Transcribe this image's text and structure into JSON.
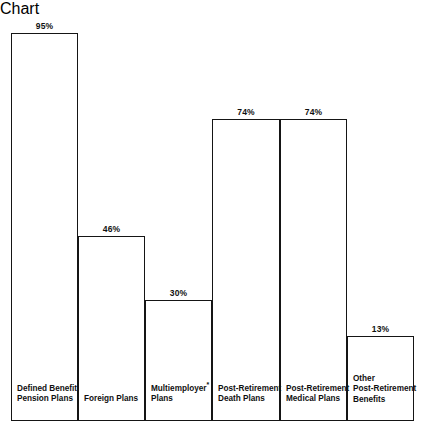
{
  "chart_data": {
    "type": "bar",
    "title": "",
    "subtitle": "",
    "xlabel": "",
    "ylabel": "",
    "ylim": [
      0,
      100
    ],
    "grid": false,
    "legend": false,
    "categories": [
      "Defined Benefit\nPension Plans",
      "Foreign Plans",
      "Multiemployer*\nPlans",
      "Post-Retirement\nDeath Plans",
      "Post-Retirement\nMedical Plans",
      "Other\nPost-Retirement\nBenefits"
    ],
    "values": [
      95,
      46,
      30,
      74,
      74,
      13
    ],
    "value_labels": [
      "95%",
      "46%",
      "30%",
      "74%",
      "74%",
      "13%"
    ],
    "footnote_marker": "*",
    "series_color": "#151515"
  },
  "bars": [
    {
      "label": "Defined Benefit\nPension Plans",
      "value_label": "95%",
      "value": 95,
      "left": 11,
      "width": 67,
      "top": 15,
      "label_top": 366
    },
    {
      "label": "Foreign Plans",
      "value_label": "46%",
      "value": 46,
      "left": 78,
      "width": 67,
      "top": 218,
      "label_top": 376
    },
    {
      "label": "Multiemployer*\nPlans",
      "value_label": "30%",
      "value": 30,
      "left": 145,
      "width": 67,
      "top": 282,
      "label_top": 366
    },
    {
      "label": "Post-Retirement\nDeath Plans",
      "value_label": "74%",
      "value": 74,
      "left": 212,
      "width": 68,
      "top": 101,
      "label_top": 366
    },
    {
      "label": "Post-Retirement\nMedical Plans",
      "value_label": "74%",
      "value": 74,
      "left": 280,
      "width": 67,
      "top": 101,
      "label_top": 366
    },
    {
      "label": "Other\nPost-Retirement\nBenefits",
      "value_label": "13%",
      "value": 13,
      "left": 347,
      "width": 67,
      "top": 318,
      "label_top": 356
    }
  ],
  "axis": {
    "baseline_y": 403
  }
}
